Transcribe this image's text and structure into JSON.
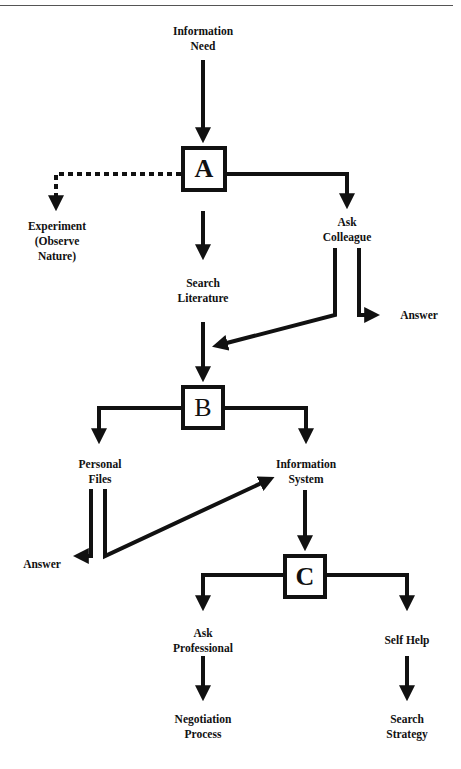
{
  "header": {
    "text": ""
  },
  "decision_points": {
    "A": {
      "label": "A"
    },
    "B": {
      "label": "B"
    },
    "C": {
      "label": "C"
    }
  },
  "nodes": {
    "information_need": [
      "Information",
      "Need"
    ],
    "experiment": [
      "Experiment",
      "(Observe",
      "Nature)"
    ],
    "search_literature": [
      "Search",
      "Literature"
    ],
    "ask_colleague": [
      "Ask",
      "Colleague"
    ],
    "answer_colleague": [
      "Answer"
    ],
    "personal_files": [
      "Personal",
      "Files"
    ],
    "information_system": [
      "Information",
      "System"
    ],
    "answer_files": [
      "Answer"
    ],
    "ask_professional": [
      "Ask",
      "Professional"
    ],
    "self_help": [
      "Self Help"
    ],
    "negotiation_process": [
      "Negotiation",
      "Process"
    ],
    "search_strategy": [
      "Search",
      "Strategy"
    ]
  },
  "edges": [
    {
      "from": "Information Need",
      "to": "A",
      "style": "solid"
    },
    {
      "from": "A",
      "to": "Experiment (Observe Nature)",
      "style": "dotted"
    },
    {
      "from": "A",
      "to": "Search Literature",
      "style": "solid"
    },
    {
      "from": "A",
      "to": "Ask Colleague",
      "style": "solid"
    },
    {
      "from": "Ask Colleague",
      "to": "Answer",
      "style": "solid"
    },
    {
      "from": "Ask Colleague",
      "to": "B",
      "style": "solid"
    },
    {
      "from": "Search Literature",
      "to": "B",
      "style": "solid"
    },
    {
      "from": "B",
      "to": "Personal Files",
      "style": "solid"
    },
    {
      "from": "B",
      "to": "Information System",
      "style": "solid"
    },
    {
      "from": "Personal Files",
      "to": "Answer",
      "style": "solid"
    },
    {
      "from": "Personal Files",
      "to": "Information System",
      "style": "solid"
    },
    {
      "from": "Information System",
      "to": "C",
      "style": "solid"
    },
    {
      "from": "C",
      "to": "Ask Professional",
      "style": "solid"
    },
    {
      "from": "C",
      "to": "Self Help",
      "style": "solid"
    },
    {
      "from": "Ask Professional",
      "to": "Negotiation Process",
      "style": "solid"
    },
    {
      "from": "Self Help",
      "to": "Search Strategy",
      "style": "solid"
    }
  ],
  "colors": {
    "stroke": "#111111",
    "background": "#ffffff"
  }
}
